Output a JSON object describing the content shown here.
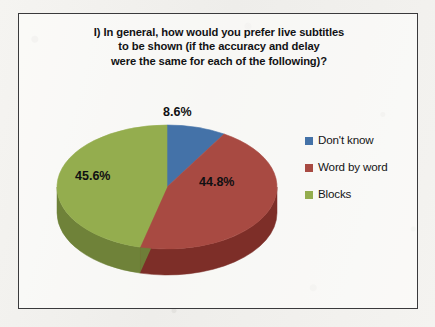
{
  "chart_data": {
    "type": "pie",
    "title": "I) In general, how would you prefer live subtitles to be shown (if the accuracy and delay were the same for each of the following)?",
    "title_lines": [
      "I) In general, how would you prefer live subtitles",
      "to be shown (if the accuracy and delay",
      "were the same for each of the following)?"
    ],
    "categories": [
      "Don't know",
      "Word by word",
      "Blocks"
    ],
    "values": [
      8.6,
      44.8,
      45.6
    ],
    "value_labels": [
      "8.6%",
      "44.8%",
      "45.6%"
    ],
    "unit": "%",
    "colors": [
      "#4472a8",
      "#a84a42",
      "#94ad4e"
    ],
    "side_colors": [
      "#2f5179",
      "#7d2e28",
      "#6f8239"
    ],
    "legend_position": "right",
    "three_d": true,
    "start_angle_deg": 0,
    "direction": "clockwise",
    "grid": false,
    "xlabel": "",
    "ylabel": ""
  },
  "frame": {
    "border_color": "#3a3a3c",
    "background_color": "#fdfdfb"
  },
  "page": {
    "background_color": "#f2f1ee"
  },
  "legend": {
    "items": [
      {
        "label": "Don't know",
        "color": "#4472a8",
        "value_label": "8.6%"
      },
      {
        "label": "Word by word",
        "color": "#a84a42",
        "value_label": "44.8%"
      },
      {
        "label": "Blocks",
        "color": "#94ad4e",
        "value_label": "45.6%"
      }
    ]
  }
}
